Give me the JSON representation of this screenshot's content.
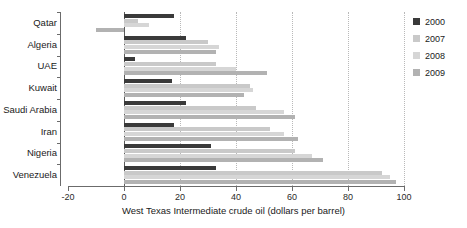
{
  "chart_data": {
    "type": "bar",
    "orientation": "horizontal",
    "title": "",
    "xlabel": "West Texas Intermediate crude oil (dollars per barrel)",
    "ylabel": "",
    "xlim": [
      -20,
      100
    ],
    "xticks": [
      -20,
      0,
      20,
      40,
      60,
      80,
      100
    ],
    "xticklabels": [
      "-20",
      "0",
      "20",
      "40",
      "60",
      "80",
      "100"
    ],
    "grid": "vertical-dotted",
    "legend_position": "right",
    "categories": [
      "Qatar",
      "Algeria",
      "UAE",
      "Kuwait",
      "Saudi Arabia",
      "Iran",
      "Nigeria",
      "Venezuela"
    ],
    "series": [
      {
        "name": "2000",
        "color": "#3a3a3a",
        "values": [
          18,
          22,
          4,
          17,
          22,
          18,
          31,
          33
        ]
      },
      {
        "name": "2007",
        "color": "#c9c9c9",
        "values": [
          5,
          30,
          33,
          45,
          47,
          52,
          61,
          92
        ]
      },
      {
        "name": "2008",
        "color": "#d6d6d6",
        "values": [
          9,
          34,
          40,
          46,
          57,
          57,
          67,
          95
        ]
      },
      {
        "name": "2009",
        "color": "#b2b2b2",
        "values": [
          -10,
          33,
          51,
          43,
          61,
          62,
          71,
          97
        ]
      }
    ]
  },
  "legend": {
    "items": [
      {
        "label": "2000",
        "color": "#3a3a3a"
      },
      {
        "label": "2007",
        "color": "#c9c9c9"
      },
      {
        "label": "2008",
        "color": "#d6d6d6"
      },
      {
        "label": "2009",
        "color": "#b2b2b2"
      }
    ]
  },
  "colors": {
    "axis": "#6b6b6b",
    "grid": "#b9b9b9",
    "text": "#1a1a1a",
    "background": "#ffffff"
  }
}
